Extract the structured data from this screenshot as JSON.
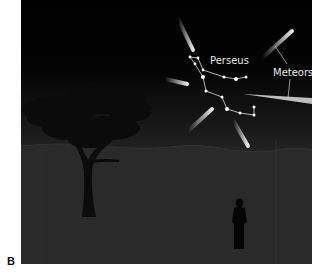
{
  "figure": {
    "panel_label": "B",
    "labels": {
      "constellation": "Perseus",
      "meteors": "Meteors"
    },
    "colors": {
      "sky_top": "#000000",
      "sky_bottom": "#2b2b2b",
      "ground": "#2a2a2a",
      "silhouette": "#0a0a0a",
      "star": "#ffffff",
      "line": "#d8d8d8",
      "label_text": "#e6e6e6"
    },
    "elements": [
      "night sky",
      "Perseus constellation",
      "6 meteor streaks radiating from Perseus",
      "tree silhouette",
      "hills",
      "standing person silhouette"
    ]
  }
}
